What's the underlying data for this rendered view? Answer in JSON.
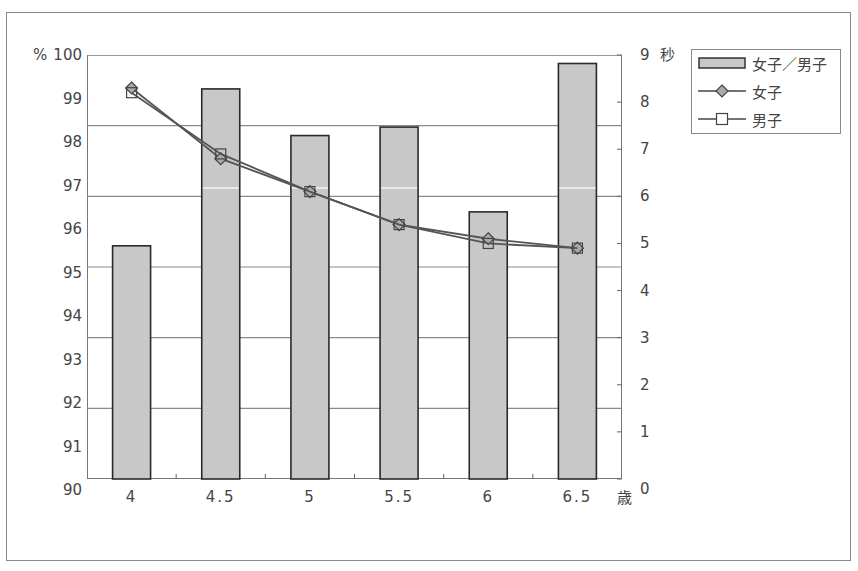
{
  "chart_data": {
    "type": "bar+line",
    "title": "",
    "xlabel": "歳",
    "ylabel_left": "%",
    "ylabel_right": "秒",
    "categories": [
      "4",
      "4.5",
      "5",
      "5.5",
      "6",
      "6.5"
    ],
    "left_axis": {
      "min": 90,
      "max": 100,
      "ticks": [
        "100",
        "99",
        "98",
        "97",
        "96",
        "95",
        "94",
        "93",
        "92",
        "91",
        "90"
      ]
    },
    "right_axis": {
      "min": 0,
      "max": 9,
      "ticks": [
        "9",
        "8",
        "7",
        "6",
        "5",
        "4",
        "3",
        "2",
        "1",
        "0"
      ]
    },
    "series": [
      {
        "name": "女子／男子",
        "type": "bar",
        "axis": "left",
        "values": [
          95.5,
          99.2,
          98.1,
          98.3,
          96.3,
          99.8
        ],
        "color": "#c8c8c8"
      },
      {
        "name": "女子",
        "type": "line",
        "axis": "right",
        "marker": "diamond",
        "values": [
          8.3,
          6.8,
          6.1,
          5.4,
          5.1,
          4.9
        ],
        "color": "#555555"
      },
      {
        "name": "男子",
        "type": "line",
        "axis": "right",
        "marker": "square",
        "values": [
          8.2,
          6.9,
          6.1,
          5.4,
          5.0,
          4.9
        ],
        "color": "#555555"
      }
    ],
    "grid": true,
    "legend_position": "top-right"
  },
  "axis": {
    "left_unit": "%",
    "right_unit": "秒",
    "x_unit": "歳"
  },
  "legend": {
    "items": [
      {
        "label": "女子／男子",
        "marker": "bar"
      },
      {
        "label": "女子",
        "marker": "diamond"
      },
      {
        "label": "男子",
        "marker": "square"
      }
    ]
  }
}
